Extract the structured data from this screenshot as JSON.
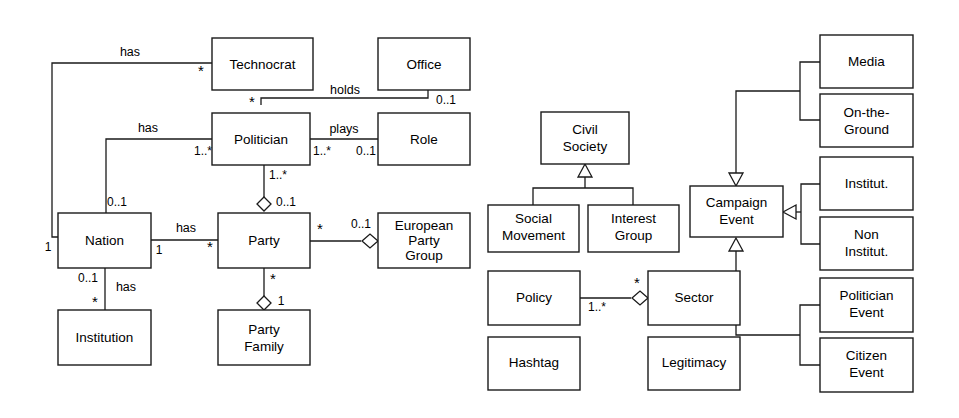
{
  "diagram": {
    "type": "uml-class-diagram",
    "width": 959,
    "height": 418,
    "background_color": "#ffffff",
    "line_color": "#1a1a1a",
    "text_color": "#000000"
  },
  "classes": {
    "technocrat": {
      "label": "Technocrat",
      "x": 212,
      "y": 38,
      "w": 101,
      "h": 52
    },
    "office": {
      "label": "Office",
      "x": 378,
      "y": 38,
      "w": 92,
      "h": 52
    },
    "politician": {
      "label": "Politician",
      "x": 212,
      "y": 113,
      "w": 98,
      "h": 52
    },
    "role": {
      "label": "Role",
      "x": 378,
      "y": 113,
      "w": 92,
      "h": 52
    },
    "nation": {
      "label": "Nation",
      "x": 58,
      "y": 213,
      "w": 93,
      "h": 55
    },
    "party": {
      "label": "Party",
      "x": 218,
      "y": 213,
      "w": 92,
      "h": 55
    },
    "european_party_group": {
      "label": "European Party Group",
      "line1": "European",
      "line2": "Party",
      "line3": "Group",
      "x": 378,
      "y": 213,
      "w": 92,
      "h": 55
    },
    "institution": {
      "label": "Institution",
      "x": 58,
      "y": 310,
      "w": 93,
      "h": 55
    },
    "party_family": {
      "label": "Party Family",
      "line1": "Party",
      "line2": "Family",
      "x": 218,
      "y": 310,
      "w": 92,
      "h": 55
    },
    "civil_society": {
      "label": "Civil Society",
      "line1": "Civil",
      "line2": "Society",
      "x": 541,
      "y": 112,
      "w": 88,
      "h": 52
    },
    "social_movement": {
      "label": "Social Movement",
      "line1": "Social",
      "line2": "Movement",
      "x": 488,
      "y": 205,
      "w": 91,
      "h": 47
    },
    "interest_group": {
      "label": "Interest Group",
      "line1": "Interest",
      "line2": "Group",
      "x": 588,
      "y": 205,
      "w": 91,
      "h": 47
    },
    "policy": {
      "label": "Policy",
      "x": 488,
      "y": 271,
      "w": 92,
      "h": 54
    },
    "sector": {
      "label": "Sector",
      "x": 648,
      "y": 271,
      "w": 92,
      "h": 54
    },
    "hashtag": {
      "label": "Hashtag",
      "x": 488,
      "y": 337,
      "w": 92,
      "h": 53
    },
    "legitimacy": {
      "label": "Legitimacy",
      "x": 648,
      "y": 337,
      "w": 92,
      "h": 53
    },
    "campaign_event": {
      "label": "Campaign Event",
      "line1": "Campaign",
      "line2": "Event",
      "x": 690,
      "y": 186,
      "w": 93,
      "h": 51
    },
    "media": {
      "label": "Media",
      "x": 820,
      "y": 35,
      "w": 93,
      "h": 53
    },
    "on_the_ground": {
      "label": "On-the-Ground",
      "line1": "On-the-",
      "line2": "Ground",
      "x": 820,
      "y": 94,
      "w": 93,
      "h": 53
    },
    "institut": {
      "label": "Institut.",
      "x": 820,
      "y": 157,
      "w": 93,
      "h": 53
    },
    "non_institut": {
      "label": "Non Institut.",
      "line1": "Non",
      "line2": "Institut.",
      "x": 820,
      "y": 217,
      "w": 93,
      "h": 53
    },
    "politician_event": {
      "label": "Politician Event",
      "line1": "Politician",
      "line2": "Event",
      "x": 820,
      "y": 278,
      "w": 93,
      "h": 54
    },
    "citizen_event": {
      "label": "Citizen Event",
      "line1": "Citizen",
      "line2": "Event",
      "x": 820,
      "y": 338,
      "w": 93,
      "h": 54
    }
  },
  "relations": {
    "nation_has_technocrat": {
      "label": "has",
      "source_mult": "1",
      "target_mult": "*"
    },
    "politician_holds_office": {
      "label": "holds",
      "source_mult": "*",
      "target_mult": "0..1"
    },
    "nation_has_politician": {
      "label": "has",
      "source_mult": "0..1",
      "target_mult": "1..*"
    },
    "politician_plays_role": {
      "label": "plays",
      "source_mult": "1..*",
      "target_mult": "0..1"
    },
    "party_has_politician": {
      "source_mult": "1..*",
      "target_mult": "0..1"
    },
    "nation_has_party": {
      "label": "has",
      "source_mult": "1",
      "target_mult": "*"
    },
    "party_in_european_group": {
      "source_mult": "*",
      "target_mult": "0..1"
    },
    "nation_has_institution": {
      "label": "has",
      "source_mult": "0..1",
      "target_mult": "*"
    },
    "party_family_of_party": {
      "source_mult": "*",
      "target_mult": "1"
    },
    "policy_sector": {
      "source_mult": "1..*",
      "target_mult": "*"
    }
  },
  "generalizations": {
    "civil_society_children": [
      "Social Movement",
      "Interest Group"
    ],
    "campaign_event_top_children": [
      "Media",
      "On-the-Ground"
    ],
    "campaign_event_mid_children": [
      "Institut.",
      "Non Institut."
    ],
    "campaign_event_bottom_children": [
      "Politician Event",
      "Citizen Event"
    ]
  }
}
